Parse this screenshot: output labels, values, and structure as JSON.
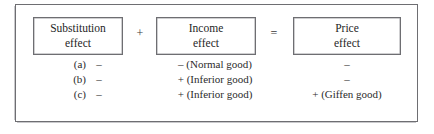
{
  "figure": {
    "type": "economics-decomposition-table",
    "boxes": [
      {
        "id": "substitution",
        "line1": "Substitution",
        "line2": "effect"
      },
      {
        "id": "income",
        "line1": "Income",
        "line2": "effect"
      },
      {
        "id": "price",
        "line1": "Price",
        "line2": "effect"
      }
    ],
    "operators": {
      "plus": "+",
      "equals": "="
    },
    "rows": [
      {
        "label": "(a)",
        "substitution_effect": "–",
        "income_effect": "–  (Normal good)",
        "price_effect": "–"
      },
      {
        "label": "(b)",
        "substitution_effect": "–",
        "income_effect": "+ (Inferior good)",
        "price_effect": "–"
      },
      {
        "label": "(c)",
        "substitution_effect": "–",
        "income_effect": "+ (Inferior good)",
        "price_effect": "+ (Giffen good)"
      }
    ],
    "colors": {
      "frame": "#6e6e72",
      "text": "#2b2b2b",
      "background": "#ffffff"
    }
  }
}
